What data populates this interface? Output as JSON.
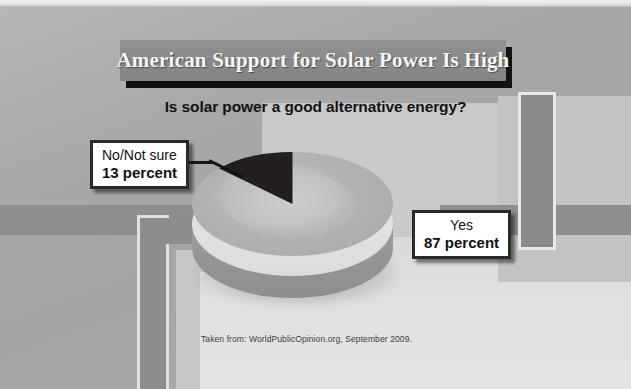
{
  "slide": {
    "title": "American Support for Solar Power Is High",
    "subtitle": "Is solar power a good alternative energy?",
    "source": "Taken from: WorldPublicOpinion.org, September 2009.",
    "colors": {
      "title_bar": "#8a8a8a",
      "title_text": "#f5f5f5",
      "title_shadow": "#121212",
      "background": "#a4a4a4",
      "panel_light": "#e0e0e0",
      "accent_bar": "#8e8e8e",
      "callout_border": "#2a2a2a",
      "callout_fill": "#ffffff",
      "slice_yes": "#b3b3b3",
      "slice_no": "#231f20"
    }
  },
  "callouts": {
    "left": {
      "label": "No/Not sure",
      "value": "13 percent"
    },
    "right": {
      "label": "Yes",
      "value": "87 percent"
    }
  },
  "chart_data": {
    "type": "pie",
    "title": "Is solar power a good alternative energy?",
    "labels": [
      "Yes",
      "No/Not sure"
    ],
    "values": [
      87,
      13
    ],
    "unit": "percent",
    "colors": [
      "#b3b3b3",
      "#231f20"
    ],
    "three_d": true,
    "start_angle_deg": 270,
    "legend": "callout-labels",
    "annotations": [
      "Yes 87 percent",
      "No/Not sure 13 percent"
    ],
    "source": "Taken from: WorldPublicOpinion.org, September 2009."
  }
}
